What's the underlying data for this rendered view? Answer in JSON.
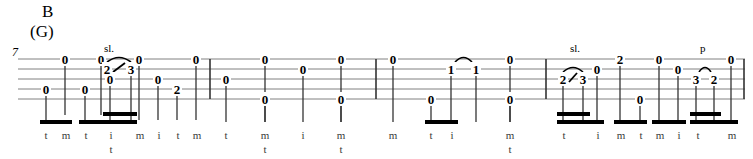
{
  "document": {
    "type": "banjo-tablature",
    "section_letter": "B",
    "chord_name": "(G)",
    "measure_number": "7",
    "staff": {
      "line_count": 5,
      "top_y": 59,
      "line_spacing": 10,
      "left_x": 18,
      "right_x": 745,
      "color": "#808080"
    },
    "barlines_x": [
      210,
      376,
      546,
      744
    ]
  },
  "technique_marks": [
    {
      "id": "sl-1",
      "label": "sl.",
      "x": 104,
      "y": 48
    },
    {
      "id": "sl-2",
      "label": "sl.",
      "x": 570,
      "y": 48
    },
    {
      "id": "p-1",
      "label": "p",
      "x": 700,
      "y": 48
    }
  ],
  "measures": [
    {
      "index": 1,
      "notes": [
        {
          "fret": "0",
          "x": 46,
          "string": 4,
          "stem_bottom": 122,
          "beam_group": 1
        },
        {
          "fret": "0",
          "x": 65,
          "string": 1,
          "stem_bottom": 115,
          "beam_group": 1
        },
        {
          "fret": "0",
          "x": 101,
          "string": 1,
          "stem_bottom": 115,
          "beam_group": 1
        },
        {
          "fret": "0",
          "x": 85,
          "string": 4,
          "stem_bottom": 122,
          "beam_group": 2
        },
        {
          "fret": "0",
          "x": 110,
          "string": 3,
          "stem_bottom": 120,
          "beam_group": 2
        },
        {
          "fret": "2",
          "x": 107,
          "string": 2,
          "stem_bottom": 0,
          "beam_group": 0
        },
        {
          "fret": "3",
          "x": 131,
          "string": 2,
          "stem_bottom": 120,
          "beam_group": 2
        },
        {
          "fret": "0",
          "x": 139,
          "string": 1,
          "stem_bottom": 120,
          "beam_group": 0
        },
        {
          "fret": "0",
          "x": 158,
          "string": 3,
          "stem_bottom": 120,
          "beam_group": 0
        },
        {
          "fret": "2",
          "x": 177,
          "string": 4,
          "stem_bottom": 120,
          "beam_group": 0
        },
        {
          "fret": "0",
          "x": 196,
          "string": 1,
          "stem_bottom": 120,
          "beam_group": 0
        }
      ],
      "slide": {
        "from": "2",
        "to": "3",
        "x1": 107,
        "x2": 131
      }
    },
    {
      "index": 2,
      "notes": [
        {
          "fret": "0",
          "x": 226,
          "string": 3
        },
        {
          "fret": "0",
          "x": 265,
          "string": 1
        },
        {
          "fret": "0",
          "x": 265,
          "string": 5
        },
        {
          "fret": "0",
          "x": 303,
          "string": 2
        },
        {
          "fret": "0",
          "x": 341,
          "string": 1
        },
        {
          "fret": "0",
          "x": 341,
          "string": 5
        }
      ]
    },
    {
      "index": 3,
      "notes": [
        {
          "fret": "0",
          "x": 393,
          "string": 1
        },
        {
          "fret": "0",
          "x": 431,
          "string": 5
        },
        {
          "fret": "1",
          "x": 451,
          "string": 2
        },
        {
          "fret": "1",
          "x": 476,
          "string": 2
        },
        {
          "fret": "0",
          "x": 510,
          "string": 1
        },
        {
          "fret": "0",
          "x": 510,
          "string": 5
        }
      ],
      "hammer": {
        "from": "1",
        "to": "1",
        "x1": 451,
        "x2": 476
      }
    },
    {
      "index": 4,
      "notes": [
        {
          "fret": "2",
          "x": 563,
          "string": 3
        },
        {
          "fret": "3",
          "x": 583,
          "string": 3
        },
        {
          "fret": "0",
          "x": 597,
          "string": 2
        },
        {
          "fret": "2",
          "x": 620,
          "string": 1
        },
        {
          "fret": "0",
          "x": 640,
          "string": 5
        },
        {
          "fret": "0",
          "x": 659,
          "string": 1
        },
        {
          "fret": "0",
          "x": 678,
          "string": 2
        },
        {
          "fret": "3",
          "x": 696,
          "string": 3
        },
        {
          "fret": "2",
          "x": 714,
          "string": 3
        },
        {
          "fret": "0",
          "x": 731,
          "string": 1
        }
      ],
      "slide": {
        "from": "2",
        "to": "3",
        "x1": 563,
        "x2": 583
      },
      "pulloff": {
        "from": "3",
        "to": "2",
        "x1": 696,
        "x2": 714
      }
    }
  ],
  "fingering": [
    {
      "x": 46,
      "top": "t",
      "bottom": ""
    },
    {
      "x": 66,
      "top": "m",
      "bottom": ""
    },
    {
      "x": 86,
      "top": "t",
      "bottom": ""
    },
    {
      "x": 111,
      "top": "i",
      "bottom": "t"
    },
    {
      "x": 140,
      "top": "m",
      "bottom": ""
    },
    {
      "x": 159,
      "top": "i",
      "bottom": ""
    },
    {
      "x": 178,
      "top": "t",
      "bottom": ""
    },
    {
      "x": 197,
      "top": "m",
      "bottom": ""
    },
    {
      "x": 226,
      "top": "t",
      "bottom": ""
    },
    {
      "x": 265,
      "top": "m",
      "bottom": "t"
    },
    {
      "x": 303,
      "top": "i",
      "bottom": ""
    },
    {
      "x": 341,
      "top": "m",
      "bottom": "t"
    },
    {
      "x": 393,
      "top": "m",
      "bottom": ""
    },
    {
      "x": 431,
      "top": "t",
      "bottom": ""
    },
    {
      "x": 452,
      "top": "i",
      "bottom": ""
    },
    {
      "x": 510,
      "top": "m",
      "bottom": "t"
    },
    {
      "x": 564,
      "top": "t",
      "bottom": ""
    },
    {
      "x": 598,
      "top": "i",
      "bottom": ""
    },
    {
      "x": 621,
      "top": "m",
      "bottom": ""
    },
    {
      "x": 641,
      "top": "t",
      "bottom": ""
    },
    {
      "x": 660,
      "top": "m",
      "bottom": ""
    },
    {
      "x": 679,
      "top": "i",
      "bottom": ""
    },
    {
      "x": 698,
      "top": "t",
      "bottom": ""
    },
    {
      "x": 732,
      "top": "m",
      "bottom": ""
    }
  ],
  "beams": [
    {
      "x1": 40,
      "x2": 72,
      "y": 120,
      "thickness": 4
    },
    {
      "x1": 79,
      "x2": 137,
      "y": 120,
      "thickness": 4
    },
    {
      "x1": 103,
      "x2": 137,
      "y": 112,
      "thickness": 4
    },
    {
      "x1": 425,
      "x2": 458,
      "y": 120,
      "thickness": 4
    },
    {
      "x1": 557,
      "x2": 604,
      "y": 120,
      "thickness": 4
    },
    {
      "x1": 557,
      "x2": 590,
      "y": 112,
      "thickness": 4
    },
    {
      "x1": 614,
      "x2": 647,
      "y": 120,
      "thickness": 4
    },
    {
      "x1": 652,
      "x2": 686,
      "y": 120,
      "thickness": 4
    },
    {
      "x1": 690,
      "x2": 738,
      "y": 120,
      "thickness": 4
    },
    {
      "x1": 690,
      "x2": 721,
      "y": 112,
      "thickness": 4
    }
  ]
}
